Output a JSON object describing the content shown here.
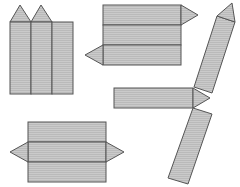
{
  "diagram": {
    "colors": {
      "face_fill": "#c8c8c8",
      "hatch_line": "#b4b4b4",
      "stroke": "#555555",
      "background": "#ffffff"
    },
    "nets": [
      {
        "id": "net-a",
        "rectangles": 3,
        "triangles": 2,
        "arrangement": "three vertical rectangles, two triangles on top"
      },
      {
        "id": "net-b",
        "rectangles": 3,
        "triangles": 2,
        "arrangement": "three horizontal rectangles, triangles on opposite ends"
      },
      {
        "id": "net-c",
        "rectangles": 3,
        "triangles": 2,
        "arrangement": "zig-zag tilted rectangles joined by triangles"
      },
      {
        "id": "net-d",
        "rectangles": 3,
        "triangles": 2,
        "arrangement": "three horizontal rectangles, triangles on both sides of middle"
      }
    ]
  }
}
